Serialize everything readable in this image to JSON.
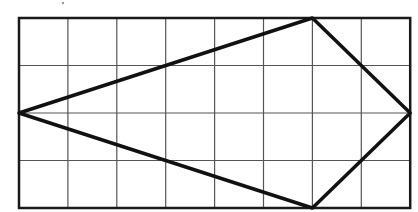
{
  "diagram": {
    "type": "grid-figure",
    "grid": {
      "columns": 8,
      "rows": 4,
      "origin_px": [
        19,
        18
      ],
      "cell_width_px": 48.9,
      "cell_height_px": 47.5
    },
    "shape": {
      "name": "kite",
      "vertices_grid": [
        [
          0,
          2
        ],
        [
          6,
          0
        ],
        [
          8,
          2
        ],
        [
          6,
          4
        ]
      ],
      "stroke_color": "#111111"
    },
    "colors": {
      "background": "#ffffff",
      "grid_line": "#555555",
      "border": "#1a1a1a"
    }
  }
}
